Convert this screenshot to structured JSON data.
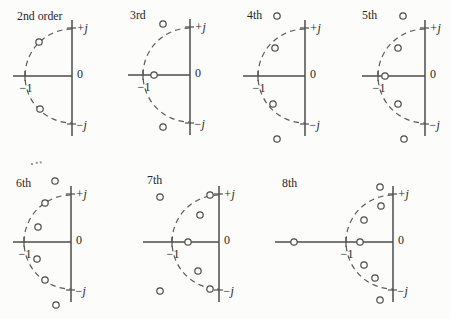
{
  "figure": {
    "background": "#fcfcfa",
    "ink_color": "#4d4d4d",
    "text_color": "#262626"
  },
  "axis_labels": {
    "plus_j": "+j",
    "zero": "0",
    "minus_j": "−j",
    "minus_one": "−1"
  },
  "geometry": {
    "axis_up": 56,
    "axis_down": 60,
    "j_tick_offset": 48,
    "tick_half": 5,
    "pole_marker_radius": 3.2
  },
  "diagrams": [
    {
      "label": "2nd order",
      "order": 2,
      "label_pos": [
        17,
        20
      ],
      "center": [
        72,
        76
      ],
      "radius": 47,
      "axis_left": 59,
      "poles": [
        [
          -33,
          -34
        ],
        [
          -32,
          33
        ]
      ]
    },
    {
      "label": "3rd",
      "order": 3,
      "label_pos": [
        130,
        19
      ],
      "center": [
        190,
        75
      ],
      "radius": 47,
      "axis_left": 62,
      "poles": [
        [
          -27,
          -51
        ],
        [
          -36,
          0
        ],
        [
          -27,
          52
        ]
      ]
    },
    {
      "label": "4th",
      "order": 4,
      "label_pos": [
        247,
        19
      ],
      "center": [
        305,
        76
      ],
      "radius": 47,
      "axis_left": 62,
      "poles": [
        [
          -28,
          -60
        ],
        [
          -30,
          -28
        ],
        [
          -32,
          28
        ],
        [
          -28,
          63
        ]
      ]
    },
    {
      "label": "5th",
      "order": 5,
      "label_pos": [
        362,
        19
      ],
      "center": [
        425,
        76
      ],
      "radius": 47,
      "axis_left": 63,
      "poles": [
        [
          -22,
          -60
        ],
        [
          -27,
          -28
        ],
        [
          -40,
          0
        ],
        [
          -27,
          28
        ],
        [
          -21,
          63
        ]
      ]
    },
    {
      "label": "6th",
      "order": 6,
      "label_pos": [
        16,
        187
      ],
      "center": [
        71,
        242
      ],
      "radius": 47,
      "axis_left": 58,
      "poles": [
        [
          -16,
          -61
        ],
        [
          -26,
          -39
        ],
        [
          -33,
          -15
        ],
        [
          -34,
          17
        ],
        [
          -26,
          38
        ],
        [
          -15,
          63
        ]
      ]
    },
    {
      "label": "7th",
      "order": 7,
      "label_pos": [
        147,
        184
      ],
      "center": [
        219,
        242
      ],
      "radius": 47,
      "axis_left": 76,
      "poles": [
        [
          -59,
          -45
        ],
        [
          -9,
          -47
        ],
        [
          -19,
          -27
        ],
        [
          -31,
          0
        ],
        [
          -21,
          29
        ],
        [
          -9,
          47
        ],
        [
          -59,
          49
        ]
      ]
    },
    {
      "label": "8th",
      "order": 8,
      "label_pos": [
        282,
        187
      ],
      "center": [
        393,
        242
      ],
      "radius": 47,
      "axis_left": 118,
      "poles": [
        [
          -13,
          -55
        ],
        [
          -12,
          -36
        ],
        [
          -29,
          -22
        ],
        [
          -99,
          0
        ],
        [
          -33,
          0
        ],
        [
          -29,
          23
        ],
        [
          -18,
          36
        ],
        [
          -13,
          58
        ]
      ]
    }
  ]
}
